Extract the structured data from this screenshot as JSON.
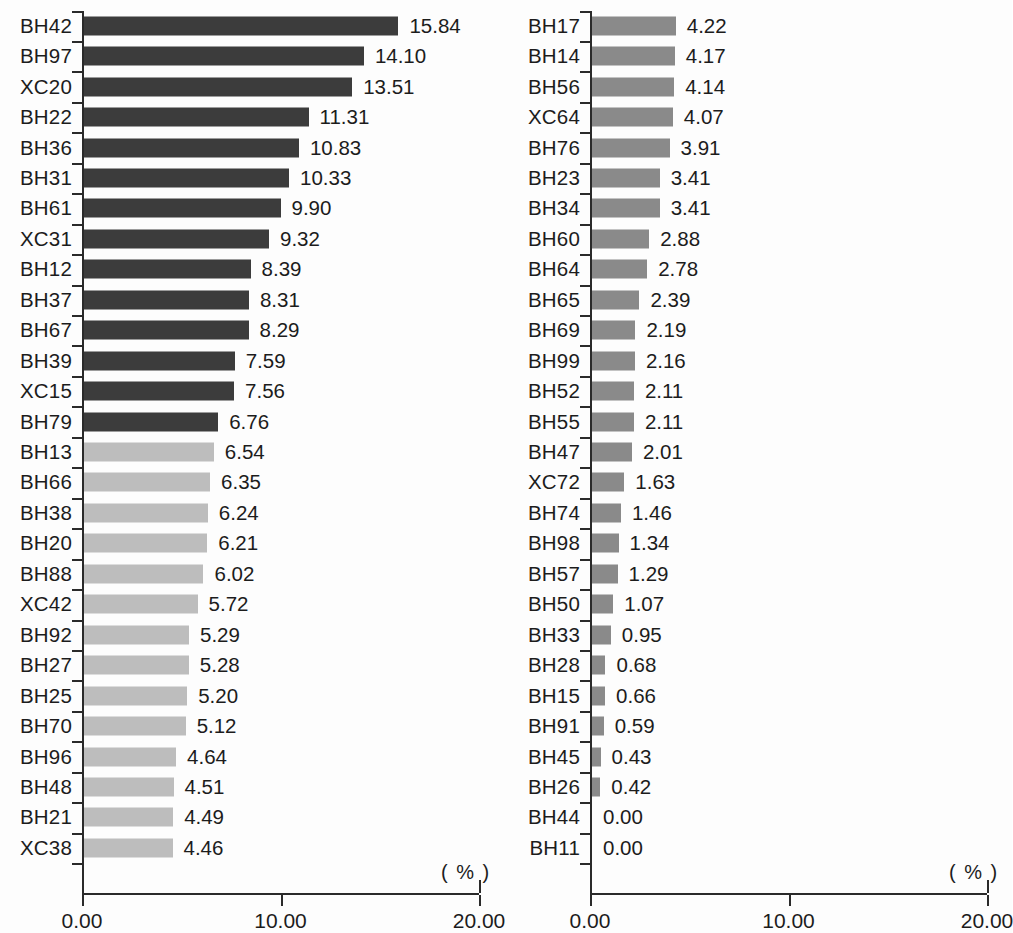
{
  "chart_data": {
    "type": "bar",
    "orientation": "horizontal",
    "title": "",
    "xlabel": "( % )",
    "ylabel": "",
    "xlim": [
      0,
      20
    ],
    "xticks": [
      0,
      10,
      20
    ],
    "xtick_labels": [
      "0.00",
      "10.00",
      "20.00"
    ],
    "grid": false,
    "legend": "none",
    "panels": [
      {
        "name": "left-panel",
        "unit_label": "( % )",
        "categories": [
          "BH42",
          "BH97",
          "XC20",
          "BH22",
          "BH36",
          "BH31",
          "BH61",
          "XC31",
          "BH12",
          "BH37",
          "BH67",
          "BH39",
          "XC15",
          "BH79",
          "BH13",
          "BH66",
          "BH38",
          "BH20",
          "BH88",
          "XC42",
          "BH92",
          "BH27",
          "BH25",
          "BH70",
          "BH96",
          "BH48",
          "BH21",
          "XC38"
        ],
        "values": [
          15.84,
          14.1,
          13.51,
          11.31,
          10.83,
          10.33,
          9.9,
          9.32,
          8.39,
          8.31,
          8.29,
          7.59,
          7.56,
          6.76,
          6.54,
          6.35,
          6.24,
          6.21,
          6.02,
          5.72,
          5.29,
          5.28,
          5.2,
          5.12,
          4.64,
          4.51,
          4.49,
          4.46
        ],
        "value_labels": [
          "15.84",
          "14.10",
          "13.51",
          "11.31",
          "10.83",
          "10.33",
          "9.90",
          "9.32",
          "8.39",
          "8.31",
          "8.29",
          "7.59",
          "7.56",
          "6.76",
          "6.54",
          "6.35",
          "6.24",
          "6.21",
          "6.02",
          "5.72",
          "5.29",
          "5.28",
          "5.20",
          "5.12",
          "4.64",
          "4.51",
          "4.49",
          "4.46"
        ],
        "bar_colors": [
          "#3c3c3c",
          "#3c3c3c",
          "#3c3c3c",
          "#3c3c3c",
          "#3c3c3c",
          "#3c3c3c",
          "#3c3c3c",
          "#3c3c3c",
          "#3c3c3c",
          "#3c3c3c",
          "#3c3c3c",
          "#3c3c3c",
          "#3c3c3c",
          "#3c3c3c",
          "#bdbdbd",
          "#bdbdbd",
          "#bdbdbd",
          "#bdbdbd",
          "#bdbdbd",
          "#bdbdbd",
          "#bdbdbd",
          "#bdbdbd",
          "#bdbdbd",
          "#bdbdbd",
          "#bdbdbd",
          "#bdbdbd",
          "#bdbdbd",
          "#bdbdbd"
        ]
      },
      {
        "name": "right-panel",
        "unit_label": "( % )",
        "categories": [
          "BH17",
          "BH14",
          "BH56",
          "XC64",
          "BH76",
          "BH23",
          "BH34",
          "BH60",
          "BH64",
          "BH65",
          "BH69",
          "BH99",
          "BH52",
          "BH55",
          "BH47",
          "XC72",
          "BH74",
          "BH98",
          "BH57",
          "BH50",
          "BH33",
          "BH28",
          "BH15",
          "BH91",
          "BH45",
          "BH26",
          "BH44",
          "BH11"
        ],
        "values": [
          4.22,
          4.17,
          4.14,
          4.07,
          3.91,
          3.41,
          3.41,
          2.88,
          2.78,
          2.39,
          2.19,
          2.16,
          2.11,
          2.11,
          2.01,
          1.63,
          1.46,
          1.34,
          1.29,
          1.07,
          0.95,
          0.68,
          0.66,
          0.59,
          0.43,
          0.42,
          0.0,
          0.0
        ],
        "value_labels": [
          "4.22",
          "4.17",
          "4.14",
          "4.07",
          "3.91",
          "3.41",
          "3.41",
          "2.88",
          "2.78",
          "2.39",
          "2.19",
          "2.16",
          "2.11",
          "2.11",
          "2.01",
          "1.63",
          "1.46",
          "1.34",
          "1.29",
          "1.07",
          "0.95",
          "0.68",
          "0.66",
          "0.59",
          "0.43",
          "0.42",
          "0.00",
          "0.00"
        ],
        "bar_colors": [
          "#8a8a8a",
          "#8a8a8a",
          "#8a8a8a",
          "#8a8a8a",
          "#8a8a8a",
          "#8a8a8a",
          "#8a8a8a",
          "#8a8a8a",
          "#8a8a8a",
          "#8a8a8a",
          "#8a8a8a",
          "#8a8a8a",
          "#8a8a8a",
          "#8a8a8a",
          "#8a8a8a",
          "#8a8a8a",
          "#8a8a8a",
          "#8a8a8a",
          "#8a8a8a",
          "#8a8a8a",
          "#8a8a8a",
          "#8a8a8a",
          "#8a8a8a",
          "#8a8a8a",
          "#8a8a8a",
          "#8a8a8a",
          "#8a8a8a",
          "#8a8a8a"
        ]
      }
    ]
  },
  "colors": {
    "bar_dark": "#3c3c3c",
    "bar_light": "#bdbdbd",
    "bar_medium": "#8a8a8a",
    "axis": "#2a2a2a",
    "text": "#1c1c1c",
    "background": "#fdfdfd"
  }
}
